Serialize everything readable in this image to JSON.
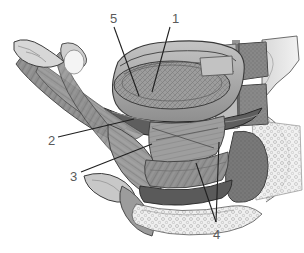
{
  "figure": {
    "style": "grayscale engraving illustration",
    "width": 304,
    "height": 253,
    "background": "#ffffff",
    "ink_color": "#1a1a1a",
    "label_color": "#5a5a5a"
  },
  "labels": [
    {
      "id": "label-1",
      "text": "1",
      "x": 172,
      "y": 12,
      "leader": {
        "x1": 170,
        "y1": 27,
        "x2": 152,
        "y2": 92
      }
    },
    {
      "id": "label-2",
      "text": "2",
      "x": 48,
      "y": 134,
      "leader": {
        "x1": 58,
        "y1": 137,
        "x2": 134,
        "y2": 119
      }
    },
    {
      "id": "label-3",
      "text": "3",
      "x": 70,
      "y": 170,
      "leader": {
        "x1": 81,
        "y1": 172,
        "x2": 152,
        "y2": 144
      }
    },
    {
      "id": "label-4",
      "text": "4",
      "x": 213,
      "y": 228,
      "leader": {
        "x1": 216,
        "y1": 222,
        "x2": 196,
        "y2": 163
      },
      "leader2": {
        "x1": 216,
        "y1": 222,
        "x2": 219,
        "y2": 142
      }
    },
    {
      "id": "label-5",
      "text": "5",
      "x": 110,
      "y": 12,
      "leader": {
        "x1": 114,
        "y1": 27,
        "x2": 139,
        "y2": 96
      }
    }
  ],
  "regions": [
    {
      "name": "hyoid-bone-left",
      "tone": "#c9c9c9"
    },
    {
      "name": "suprahyoid-muscle-band",
      "tone": "#8f8f8f"
    },
    {
      "name": "tongue-body-oval",
      "tone": "#9a9a9a"
    },
    {
      "name": "epiglottis-rim",
      "tone": "#6a6a6a"
    },
    {
      "name": "laryngeal-muscles",
      "tone": "#8a8a8a"
    },
    {
      "name": "thyroid-cartilage",
      "tone": "#b4b4b4"
    },
    {
      "name": "cervical-vertebra-body",
      "tone": "#6e6e6e"
    },
    {
      "name": "spongy-bone-texture",
      "tone": "#e2e2e2"
    }
  ]
}
